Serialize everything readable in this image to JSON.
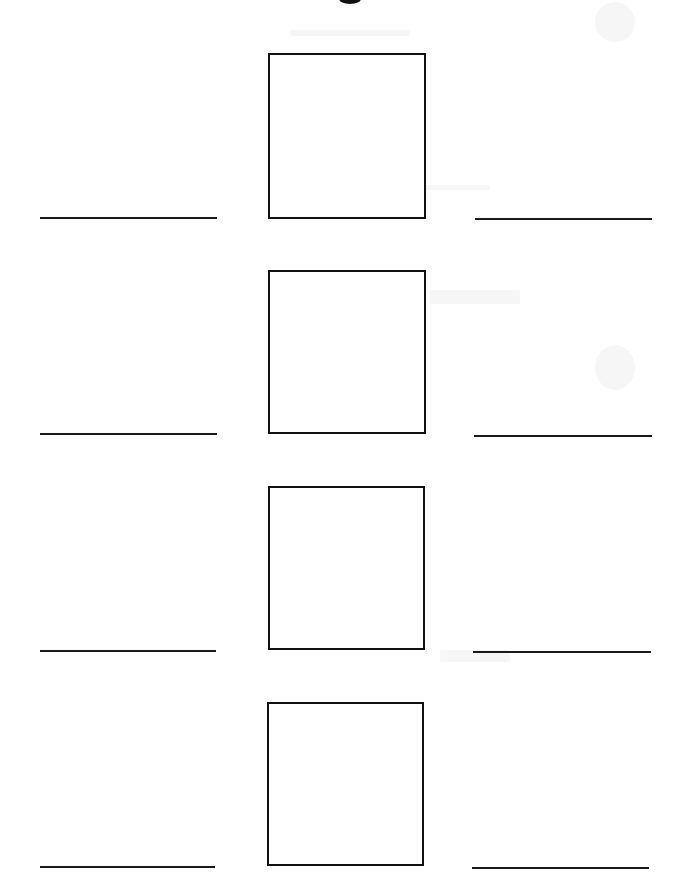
{
  "document": {
    "type": "worksheet",
    "description": "Matching worksheet with four picture boxes, each flanked by blank answer lines on the left and right"
  },
  "header": {
    "fragment": "cut-off heading glyph at top edge"
  },
  "rows": [
    {
      "index": 1,
      "box": {
        "x": 268,
        "y": 53,
        "w": 156,
        "h": 166,
        "label": "Picture box 1"
      },
      "left_line": {
        "x1": 40,
        "x2": 217,
        "y": 218,
        "label": "Answer line 1 (left)",
        "value": ""
      },
      "right_line": {
        "x1": 475,
        "x2": 652,
        "y": 219,
        "label": "Answer line 1 (right)",
        "value": ""
      }
    },
    {
      "index": 2,
      "box": {
        "x": 268,
        "y": 270,
        "w": 156,
        "h": 164,
        "label": "Picture box 2"
      },
      "left_line": {
        "x1": 40,
        "x2": 217,
        "y": 434,
        "label": "Answer line 2 (left)",
        "value": ""
      },
      "right_line": {
        "x1": 474,
        "x2": 652,
        "y": 436,
        "label": "Answer line 2 (right)",
        "value": ""
      }
    },
    {
      "index": 3,
      "box": {
        "x": 268,
        "y": 486,
        "w": 155,
        "h": 164,
        "label": "Picture box 3"
      },
      "left_line": {
        "x1": 40,
        "x2": 216,
        "y": 651,
        "label": "Answer line 3 (left)",
        "value": ""
      },
      "right_line": {
        "x1": 473,
        "x2": 651,
        "y": 652,
        "label": "Answer line 3 (right)",
        "value": ""
      }
    },
    {
      "index": 4,
      "box": {
        "x": 267,
        "y": 702,
        "w": 155,
        "h": 164,
        "label": "Picture box 4"
      },
      "left_line": {
        "x1": 40,
        "x2": 215,
        "y": 867,
        "label": "Answer line 4 (left)",
        "value": ""
      },
      "right_line": {
        "x1": 472,
        "x2": 649,
        "y": 868,
        "label": "Answer line 4 (right)",
        "value": ""
      }
    }
  ],
  "colors": {
    "background": "#ffffff",
    "ink": "#111111",
    "line": "#1a1a1a"
  }
}
